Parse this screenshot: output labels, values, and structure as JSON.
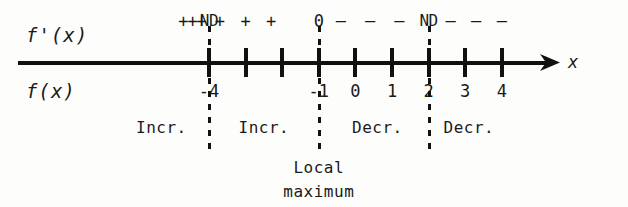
{
  "figure": {
    "type": "sign-chart-number-line",
    "row_labels": {
      "derivative": "f'(x)",
      "function": "f(x)",
      "axis": "x"
    },
    "axis": {
      "tick_values": [
        -4,
        -3,
        -2,
        -1,
        0,
        1,
        2,
        4
      ],
      "visible_tick_labels": [
        "-4",
        "-1",
        "0",
        "1",
        "2",
        "3",
        "4"
      ],
      "arrow_direction": "right",
      "x_min": -5,
      "x_max": 5
    },
    "sign_row": {
      "entries": [
        {
          "text": "+",
          "x": -4.7,
          "kind": "sign"
        },
        {
          "text": "+",
          "x": -4.45,
          "kind": "sign"
        },
        {
          "text": "+",
          "x": -4.2,
          "kind": "sign"
        },
        {
          "text": "ND",
          "x": -4,
          "kind": "critical"
        },
        {
          "text": "+",
          "x": -3.7,
          "kind": "sign"
        },
        {
          "text": "+",
          "x": -3.0,
          "kind": "sign"
        },
        {
          "text": "+",
          "x": -2.3,
          "kind": "sign"
        },
        {
          "text": "0",
          "x": -1,
          "kind": "critical"
        },
        {
          "text": "–",
          "x": -0.4,
          "kind": "sign"
        },
        {
          "text": "–",
          "x": 0.4,
          "kind": "sign"
        },
        {
          "text": "–",
          "x": 1.2,
          "kind": "sign"
        },
        {
          "text": "ND",
          "x": 2,
          "kind": "critical"
        },
        {
          "text": "–",
          "x": 2.6,
          "kind": "sign"
        },
        {
          "text": "–",
          "x": 3.3,
          "kind": "sign"
        },
        {
          "text": "–",
          "x": 4.0,
          "kind": "sign"
        }
      ]
    },
    "number_labels": [
      {
        "text": "-4",
        "x": -4
      },
      {
        "text": "-1",
        "x": -1
      },
      {
        "text": "0",
        "x": 0
      },
      {
        "text": "1",
        "x": 1
      },
      {
        "text": "2",
        "x": 2
      },
      {
        "text": "3",
        "x": 3
      },
      {
        "text": "4",
        "x": 4
      }
    ],
    "behavior_row": [
      {
        "text": "Incr.",
        "x": -5.3
      },
      {
        "text": "Incr.",
        "x": -2.5
      },
      {
        "text": "Decr.",
        "x": 0.6
      },
      {
        "text": "Decr.",
        "x": 3.1
      }
    ],
    "critical_lines": [
      {
        "x": -4,
        "top": 26,
        "bottom": 152
      },
      {
        "x": -1,
        "top": 26,
        "bottom": 152
      },
      {
        "x": 2,
        "top": 26,
        "bottom": 152
      }
    ],
    "annotations": [
      {
        "line1": "Local",
        "line2": "maximum",
        "x": -1
      }
    ]
  },
  "colors": {
    "ink": "#111111",
    "paper": "#fdfdfb"
  }
}
